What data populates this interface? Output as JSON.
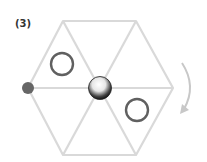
{
  "diagram": {
    "label": "(3)",
    "colors": {
      "grid_lines": "#d9d9d9",
      "open_circle_stroke": "#606060",
      "filled_dot": "#666666",
      "sphere_dark": "#1a1a1a",
      "sphere_light": "#ffffff",
      "arrow": "#c8c8c8"
    },
    "hexagon": {
      "center": [
        100,
        88
      ],
      "vertices": [
        [
          63,
          21
        ],
        [
          136,
          21
        ],
        [
          173,
          88
        ],
        [
          136,
          155
        ],
        [
          63,
          155
        ],
        [
          28,
          88
        ]
      ]
    },
    "open_circles": [
      {
        "cx": 62,
        "cy": 64,
        "r": 11
      },
      {
        "cx": 137,
        "cy": 110,
        "r": 11
      }
    ],
    "filled_dot": {
      "cx": 28,
      "cy": 88,
      "r": 6
    },
    "center_sphere": {
      "cx": 100,
      "cy": 88,
      "r": 11
    },
    "rotation_arrow": {
      "direction": "clockwise"
    }
  }
}
